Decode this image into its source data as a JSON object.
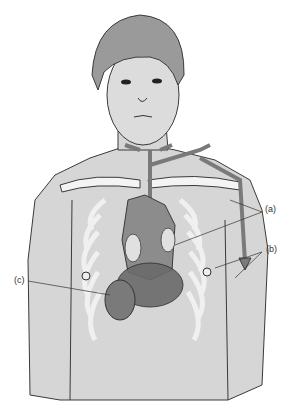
{
  "figure": {
    "type": "anatomical-illustration",
    "labels": [
      {
        "id": "a",
        "text": "(a)",
        "x": 265,
        "y": 208
      },
      {
        "id": "b",
        "text": "(b)",
        "x": 266,
        "y": 248
      },
      {
        "id": "c",
        "text": "(c)",
        "x": 14,
        "y": 278
      }
    ],
    "colors": {
      "skin": "#d6d6d6",
      "hair": "#9a9a9a",
      "outline": "#3a3a3a",
      "ribs": "#f4f4f4",
      "vessels": "#7a7a7a",
      "heart": "#8c8c8c",
      "organs_dark": "#6a6a6a"
    }
  }
}
